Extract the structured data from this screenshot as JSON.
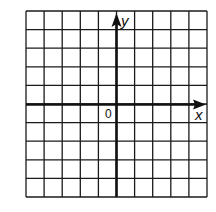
{
  "diagram": {
    "type": "coordinate-grid",
    "grid": {
      "columns": 10,
      "rows": 10,
      "x_min": -5,
      "x_max": 5,
      "y_min": -5,
      "y_max": 5
    },
    "axes": {
      "x_label": "x",
      "y_label": "y",
      "origin_label": "0"
    },
    "colors": {
      "line": "#1a1a1a",
      "background": "#ffffff"
    }
  }
}
